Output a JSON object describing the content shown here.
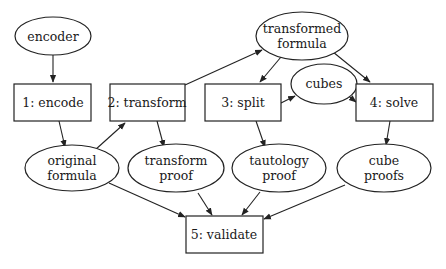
{
  "diagram": {
    "nodes": {
      "encoder": {
        "label_lines": [
          "encoder"
        ],
        "shape": "ellipse"
      },
      "encode": {
        "label_lines": [
          "1: encode"
        ],
        "shape": "box"
      },
      "transform": {
        "label_lines": [
          "2: transform"
        ],
        "shape": "box"
      },
      "split": {
        "label_lines": [
          "3: split"
        ],
        "shape": "box"
      },
      "solve": {
        "label_lines": [
          "4: solve"
        ],
        "shape": "box"
      },
      "validate": {
        "label_lines": [
          "5: validate"
        ],
        "shape": "box"
      },
      "transformed_formula": {
        "label_lines": [
          "transformed",
          "formula"
        ],
        "shape": "ellipse"
      },
      "cubes": {
        "label_lines": [
          "cubes"
        ],
        "shape": "ellipse"
      },
      "original_formula": {
        "label_lines": [
          "original",
          "formula"
        ],
        "shape": "ellipse"
      },
      "transform_proof": {
        "label_lines": [
          "transform",
          "proof"
        ],
        "shape": "ellipse"
      },
      "tautology_proof": {
        "label_lines": [
          "tautology",
          "proof"
        ],
        "shape": "ellipse"
      },
      "cube_proofs": {
        "label_lines": [
          "cube",
          "proofs"
        ],
        "shape": "ellipse"
      }
    },
    "edges": [
      {
        "from": "encoder",
        "to": "encode"
      },
      {
        "from": "encode",
        "to": "original_formula"
      },
      {
        "from": "original_formula",
        "to": "transform"
      },
      {
        "from": "transform",
        "to": "transformed_formula"
      },
      {
        "from": "transform",
        "to": "transform_proof"
      },
      {
        "from": "transformed_formula",
        "to": "split"
      },
      {
        "from": "transformed_formula",
        "to": "solve"
      },
      {
        "from": "split",
        "to": "cubes"
      },
      {
        "from": "cubes",
        "to": "solve"
      },
      {
        "from": "split",
        "to": "tautology_proof"
      },
      {
        "from": "solve",
        "to": "cube_proofs"
      },
      {
        "from": "original_formula",
        "to": "validate"
      },
      {
        "from": "transform_proof",
        "to": "validate"
      },
      {
        "from": "tautology_proof",
        "to": "validate"
      },
      {
        "from": "cube_proofs",
        "to": "validate"
      }
    ]
  }
}
